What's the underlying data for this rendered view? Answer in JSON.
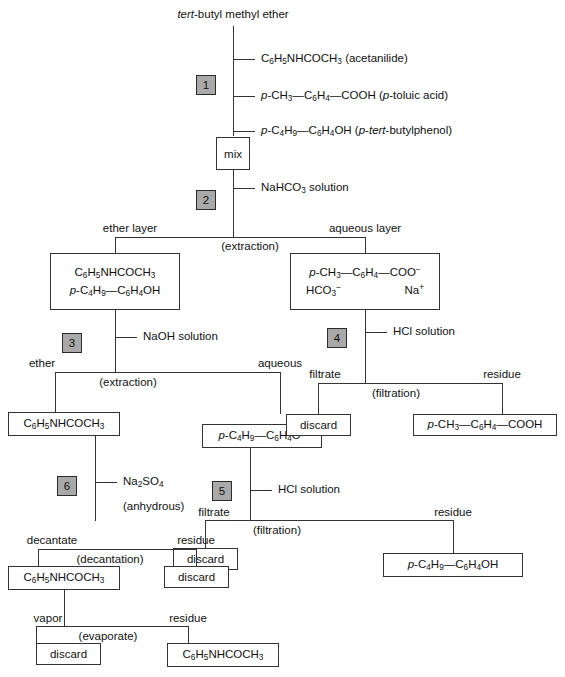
{
  "diagram": {
    "title": "tert-butyl methyl ether",
    "title_italic_prefix": "tert",
    "title_rest": "-butyl methyl ether",
    "reagents_top": [
      "C6H5NHCOCH3 (acetanilide)",
      "p-CH3—C6H4—COOH (p-toluic acid)",
      "p-C4H9—C6H4OH (p-tert-butylphenol)"
    ],
    "mix_label": "mix",
    "bicarbonate_reagent": "NaHCO3 solution",
    "steps": {
      "s1": "1",
      "s2": "2",
      "s3": "3",
      "s4": "4",
      "s5": "5",
      "s6": "6"
    },
    "branch_labels": {
      "ether_layer": "ether layer",
      "aqueous_layer": "aqueous layer",
      "extraction_1": "(extraction)",
      "ether": "ether",
      "aqueous": "aqueous",
      "extraction_2": "(extraction)",
      "filtrate_4": "filtrate",
      "residue_4": "residue",
      "filtration_4": "(filtration)",
      "filtrate_5": "filtrate",
      "residue_5": "residue",
      "filtration_5": "(filtration)",
      "decantate": "decantate",
      "residue_6": "residue",
      "decantation": "(decantation)",
      "vapor": "vapor",
      "residue_7": "residue",
      "evaporate": "(evaporate)"
    },
    "reagents_mid": {
      "naoh": "NaOH solution",
      "hcl_4": "HCl solution",
      "hcl_5": "HCl solution",
      "na2so4": "Na2SO4",
      "anhydrous": "(anhydrous)"
    },
    "boxes": {
      "ether_layer_box": [
        "C6H5NHCOCH3",
        "p-C4H9—C6H4OH"
      ],
      "aqueous_layer_box": [
        "p-CH3—C6H4—COO−",
        "HCO3−        Na+"
      ],
      "discard_4": "discard",
      "toluic_acid": "p-CH3—C6H4—COOH",
      "acetanilide_mid": "C6H5NHCOCH3",
      "phenolate": "p-C4H9—C6H4O−",
      "discard_5": "discard",
      "butylphenol": "p-C4H9—C6H4OH",
      "acetanilide_dry": "C6H5NHCOCH3",
      "discard_6": "discard",
      "discard_7": "discard",
      "acetanilide_final": "C6H5NHCOCH3"
    },
    "colors": {
      "step_fill": "#a9a9a9",
      "line": "#333333",
      "background": "#ffffff"
    }
  }
}
